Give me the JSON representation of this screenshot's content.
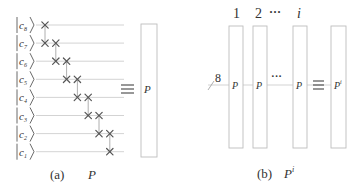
{
  "panel_a": {
    "qubits": [
      {
        "label": "c",
        "sub": "8"
      },
      {
        "label": "c",
        "sub": "7"
      },
      {
        "label": "c",
        "sub": "6"
      },
      {
        "label": "c",
        "sub": "5"
      },
      {
        "label": "c",
        "sub": "4"
      },
      {
        "label": "c",
        "sub": "3"
      },
      {
        "label": "c",
        "sub": "2"
      },
      {
        "label": "c",
        "sub": "1"
      }
    ],
    "swap_gates": [
      {
        "wires": [
          0,
          1
        ]
      },
      {
        "wires": [
          1,
          2
        ]
      },
      {
        "wires": [
          2,
          3
        ]
      },
      {
        "wires": [
          3,
          4
        ]
      },
      {
        "wires": [
          4,
          5
        ]
      },
      {
        "wires": [
          5,
          6
        ]
      },
      {
        "wires": [
          6,
          7
        ]
      }
    ],
    "equiv_symbol": "≡",
    "box_label": "P",
    "caption_tag": "(a)",
    "caption_label": "P"
  },
  "panel_b": {
    "column_labels": [
      "1",
      "2",
      "···",
      "i"
    ],
    "bus_width": "8",
    "box_labels": [
      "P",
      "P",
      "P"
    ],
    "dots": "···",
    "equiv_symbol": "≡",
    "result_label": "P",
    "result_sup": "i",
    "caption_tag": "(b)",
    "caption_label": "P",
    "caption_sup": "i"
  }
}
